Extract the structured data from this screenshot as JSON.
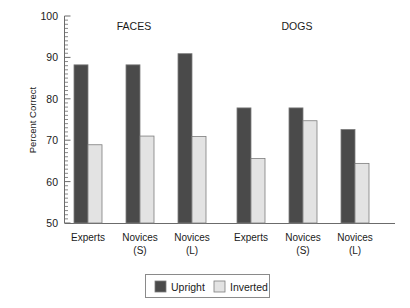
{
  "chart_data": {
    "type": "bar",
    "title": "",
    "xlabel": "",
    "ylabel": "Percent Correct",
    "ylim": [
      50,
      100
    ],
    "ytick_values": [
      50,
      60,
      70,
      80,
      90,
      100
    ],
    "ytick_labels": [
      "50",
      "60",
      "70",
      "80",
      "90",
      "100"
    ],
    "minor_tick_step": 1,
    "grid": false,
    "legend_position": "bottom-center",
    "panels": [
      {
        "name": "FACES",
        "categories": [
          "Experts",
          "Novices (S)",
          "Novices (L)"
        ],
        "series": [
          {
            "name": "Upright",
            "values": [
              88.2,
              88.2,
              90.9
            ]
          },
          {
            "name": "Inverted",
            "values": [
              68.9,
              71.0,
              70.9
            ]
          }
        ]
      },
      {
        "name": "DOGS",
        "categories": [
          "Experts",
          "Novices (S)",
          "Novices (L)"
        ],
        "series": [
          {
            "name": "Upright",
            "values": [
              77.8,
              77.8,
              72.6
            ]
          },
          {
            "name": "Inverted",
            "values": [
              65.6,
              74.7,
              64.4
            ]
          }
        ]
      }
    ],
    "series_colors": {
      "Upright": "#4a4a4a",
      "Inverted": "#e3e3e3"
    }
  },
  "axis": {
    "y_title": "Percent Correct",
    "ticks": [
      {
        "label": "100",
        "value": 100
      },
      {
        "label": "90",
        "value": 90
      },
      {
        "label": "80",
        "value": 80
      },
      {
        "label": "70",
        "value": 70
      },
      {
        "label": "60",
        "value": 60
      },
      {
        "label": "50",
        "value": 50
      }
    ]
  },
  "panel_titles": {
    "left": "FACES",
    "right": "DOGS"
  },
  "category_labels": {
    "faces": [
      {
        "line1": "Experts",
        "line2": ""
      },
      {
        "line1": "Novices",
        "line2": "(S)"
      },
      {
        "line1": "Novices",
        "line2": "(L)"
      }
    ],
    "dogs": [
      {
        "line1": "Experts",
        "line2": ""
      },
      {
        "line1": "Novices",
        "line2": "(S)"
      },
      {
        "line1": "Novices",
        "line2": "(L)"
      }
    ]
  },
  "legend": {
    "items": [
      {
        "label": "Upright",
        "color": "#4a4a4a"
      },
      {
        "label": "Inverted",
        "color": "#e3e3e3"
      }
    ]
  },
  "colors": {
    "upright": "#4a4a4a",
    "inverted": "#e3e3e3",
    "bar_border": "#7d7d7d",
    "axis": "#6b6b6b",
    "legend_border": "#8a8a8a"
  }
}
